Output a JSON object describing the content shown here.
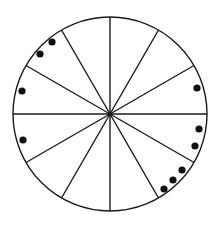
{
  "diagram": {
    "type": "sector-wheel",
    "center": [
      110,
      114
    ],
    "radius": 97,
    "sector_count": 12,
    "stroke_color": "#1a1a1a",
    "dot_color": "#111111",
    "dot_radius": 3.6,
    "dots": [
      {
        "x": 52,
        "y": 42
      },
      {
        "x": 40,
        "y": 54
      },
      {
        "x": 22,
        "y": 91
      },
      {
        "x": 23,
        "y": 140
      },
      {
        "x": 197,
        "y": 88
      },
      {
        "x": 199,
        "y": 129
      },
      {
        "x": 195,
        "y": 146
      },
      {
        "x": 182,
        "y": 170
      },
      {
        "x": 173,
        "y": 180
      },
      {
        "x": 164,
        "y": 189
      }
    ]
  }
}
